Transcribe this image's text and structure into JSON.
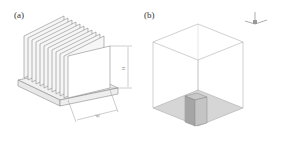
{
  "panels": [
    {
      "label": "(a)",
      "subject": "finned heat sink, isometric view",
      "fin_count": 12,
      "dimensions": {
        "height_label": "H",
        "width_label": "W"
      }
    },
    {
      "label": "(b)",
      "subject": "heat sink inside cubic computational domain",
      "axes_triad": {
        "labels": [
          "Y",
          "X",
          "Z"
        ]
      }
    }
  ],
  "colors": {
    "line": "#8a8a8a",
    "fin_fill": "#f4f4f4",
    "floor_fill": "#d4d4d4",
    "sink_fill": "#b5b5b5"
  }
}
